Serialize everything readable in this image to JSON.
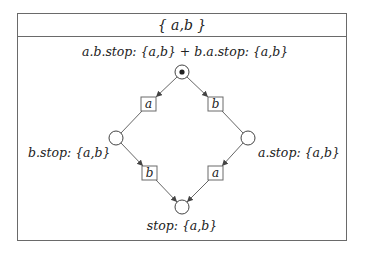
{
  "title": "{ a,b }",
  "nodes": [
    {
      "id": "start",
      "label": "a.b.stop: {a,b} + b.a.stop: {a,b}",
      "initial": true
    },
    {
      "id": "after-a",
      "label": "b.stop: {a,b}"
    },
    {
      "id": "after-b",
      "label": "a.stop: {a,b}"
    },
    {
      "id": "final",
      "label": "stop: {a,b}"
    }
  ],
  "transitions": [
    {
      "from": "start",
      "to": "after-a",
      "action": "a"
    },
    {
      "from": "start",
      "to": "after-b",
      "action": "b"
    },
    {
      "from": "after-a",
      "to": "final",
      "action": "b"
    },
    {
      "from": "after-b",
      "to": "final",
      "action": "a"
    }
  ],
  "colors": {
    "line": "#555555",
    "box": "#6a6a6a",
    "text": "#222222"
  }
}
